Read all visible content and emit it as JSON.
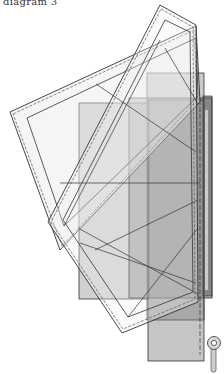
{
  "caption": "diagram 3",
  "colors": {
    "paper_light": "#ececec",
    "paper_mid": "#b8b8b8",
    "paper_dark": "#8a8a8a",
    "stroke": "#333333",
    "background": "#ffffff"
  },
  "elements": {
    "frame_wide": "tilted-wide-frame",
    "frame_tall": "tilted-tall-frame",
    "sheet_left": "light-gray-sheet",
    "sheet_right": "dark-gray-sheet",
    "sheet_back": "mid-gray-sheet",
    "key_icon": "key-ring"
  }
}
